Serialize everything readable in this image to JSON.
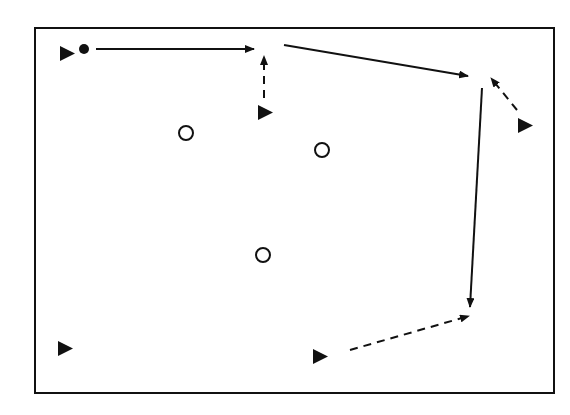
{
  "diagram": {
    "type": "play-diagram",
    "colors": {
      "ink": "#111111",
      "background": "#ffffff"
    },
    "frame": {
      "x": 35,
      "y": 28,
      "width": 519,
      "height": 365
    },
    "players_triangle": [
      {
        "id": "p1",
        "x": 60,
        "y": 46,
        "label": ""
      },
      {
        "id": "p2",
        "x": 258,
        "y": 105,
        "label": ""
      },
      {
        "id": "p3",
        "x": 518,
        "y": 118,
        "label": ""
      },
      {
        "id": "p4",
        "x": 58,
        "y": 341,
        "label": ""
      },
      {
        "id": "p5",
        "x": 313,
        "y": 349,
        "label": ""
      }
    ],
    "ball": {
      "x": 84,
      "y": 49,
      "r": 5
    },
    "defenders_circle": [
      {
        "id": "d1",
        "x": 186,
        "y": 133,
        "r": 7
      },
      {
        "id": "d2",
        "x": 322,
        "y": 150,
        "r": 7
      },
      {
        "id": "d3",
        "x": 263,
        "y": 255,
        "r": 7
      }
    ],
    "arrows": [
      {
        "id": "a1",
        "style": "solid",
        "from": [
          96,
          49
        ],
        "to": [
          254,
          49
        ],
        "description": "pass/run right along top"
      },
      {
        "id": "a2",
        "style": "dashed",
        "from": [
          264,
          98
        ],
        "to": [
          264,
          56
        ],
        "description": "dribble up"
      },
      {
        "id": "a3",
        "style": "solid",
        "from": [
          284,
          45
        ],
        "to": [
          468,
          76
        ],
        "description": "run to top-right"
      },
      {
        "id": "a4",
        "style": "dashed",
        "from": [
          517,
          110
        ],
        "to": [
          491,
          78
        ],
        "description": "dashed run up-left"
      },
      {
        "id": "a5",
        "style": "solid",
        "from": [
          482,
          88
        ],
        "to": [
          470,
          307
        ],
        "description": "run down right side"
      },
      {
        "id": "a6",
        "style": "dashed",
        "from": [
          350,
          350
        ],
        "to": [
          469,
          316
        ],
        "description": "dashed run to bottom-right"
      }
    ]
  }
}
